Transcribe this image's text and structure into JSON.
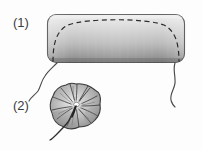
{
  "figure": {
    "type": "patent-line-drawing",
    "background_color": "#fdfdfd",
    "width": 202,
    "height": 150,
    "labels": [
      {
        "id": "1",
        "text": "(1)",
        "x": 13,
        "y": 16
      },
      {
        "id": "2",
        "text": "(2)",
        "x": 13,
        "y": 99
      }
    ],
    "parts": {
      "panel": {
        "name": "rounded-rectangle-panel",
        "label_ref": "(1)",
        "x": 47,
        "y": 14,
        "width": 138,
        "height": 49,
        "corner_radius": 9,
        "outline_color": "#4a4a4a",
        "outline_width": 1.1,
        "gradient_top_color": "#e8e8e8",
        "gradient_mid_color": "#c4c4c4",
        "gradient_bottom_color": "#7d7d7d",
        "inner_dashed_curve": {
          "name": "dashed-arch-curve",
          "stroke_color": "#2b2b2b",
          "stroke_width": 1.2,
          "dash_pattern": "5,3.5",
          "description": "broad dome arch spanning panel width"
        }
      },
      "cord_left": {
        "name": "drawstring-cord-left",
        "stroke_color": "#4a4a4a",
        "stroke_width": 1.1,
        "description": "wavy cord from bottom-left corner of panel"
      },
      "cord_right": {
        "name": "drawstring-cord-right",
        "stroke_color": "#4a4a4a",
        "stroke_width": 1.1,
        "description": "wavy cord from bottom-right corner of panel"
      },
      "rosette": {
        "name": "gathered-fabric-rosette",
        "label_ref": "(2)",
        "center_x": 76,
        "center_y": 108,
        "radius": 24,
        "outline_color": "#3a3a3a",
        "outline_width": 1.1,
        "fill_light_color": "#d8d8d8",
        "fill_mid_color": "#b2b2b2",
        "fill_shadow_color": "#8a8a8a",
        "center_highlight_color": "#f6f6f6",
        "pleat_stroke_color": "#2e2e2e",
        "pleat_count": 14,
        "tail_cord": {
          "name": "rosette-tail-cord",
          "stroke_color": "#2e2e2e",
          "stroke_width": 1.2,
          "description": "cord trailing down-left from rosette center"
        }
      }
    }
  }
}
